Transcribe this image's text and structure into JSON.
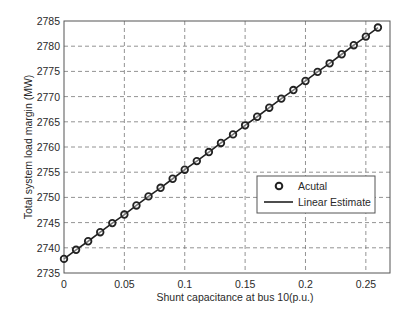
{
  "chart_data": {
    "type": "line",
    "title": "",
    "xlabel": "Shunt capacitance at bus 10(p.u.)",
    "ylabel": "Total system load margin (MW)",
    "xlim": [
      0,
      0.27
    ],
    "ylim": [
      2735,
      2785
    ],
    "xticks": [
      0,
      0.05,
      0.1,
      0.15,
      0.2,
      0.25
    ],
    "xtick_labels": [
      "0",
      "0.05",
      "0.1",
      "0.15",
      "0.2",
      "0.25"
    ],
    "yticks": [
      2735,
      2740,
      2745,
      2750,
      2755,
      2760,
      2765,
      2770,
      2775,
      2780,
      2785
    ],
    "ytick_labels": [
      "2735",
      "2740",
      "2745",
      "2750",
      "2755",
      "2760",
      "2765",
      "2770",
      "2775",
      "2780",
      "2785"
    ],
    "grid": true,
    "legend_position": "center right",
    "x": [
      0,
      0.01,
      0.02,
      0.03,
      0.04,
      0.05,
      0.06,
      0.07,
      0.08,
      0.09,
      0.1,
      0.11,
      0.12,
      0.13,
      0.14,
      0.15,
      0.16,
      0.17,
      0.18,
      0.19,
      0.2,
      0.21,
      0.22,
      0.23,
      0.24,
      0.25,
      0.26
    ],
    "series": [
      {
        "name": "Acutal",
        "style": "markers",
        "marker": "circle",
        "values": [
          2737.8,
          2739.6,
          2741.3,
          2743.1,
          2744.9,
          2746.6,
          2748.4,
          2750.2,
          2751.9,
          2753.7,
          2755.5,
          2757.2,
          2759.0,
          2760.8,
          2762.5,
          2764.3,
          2766.0,
          2767.8,
          2769.6,
          2771.3,
          2773.1,
          2774.9,
          2776.6,
          2778.4,
          2780.2,
          2781.9,
          2783.7
        ]
      },
      {
        "name": "Linear Estimate",
        "style": "line",
        "values": [
          2737.8,
          2739.6,
          2741.3,
          2743.1,
          2744.9,
          2746.6,
          2748.4,
          2750.2,
          2751.9,
          2753.7,
          2755.5,
          2757.2,
          2759.0,
          2760.8,
          2762.5,
          2764.3,
          2766.0,
          2767.8,
          2769.6,
          2771.3,
          2773.1,
          2774.9,
          2776.6,
          2778.4,
          2780.2,
          2781.9,
          2783.7
        ]
      }
    ]
  },
  "colors": {
    "axis": "#555555",
    "grid": "#777777",
    "series": "#222222",
    "text": "#2a2a2a"
  }
}
